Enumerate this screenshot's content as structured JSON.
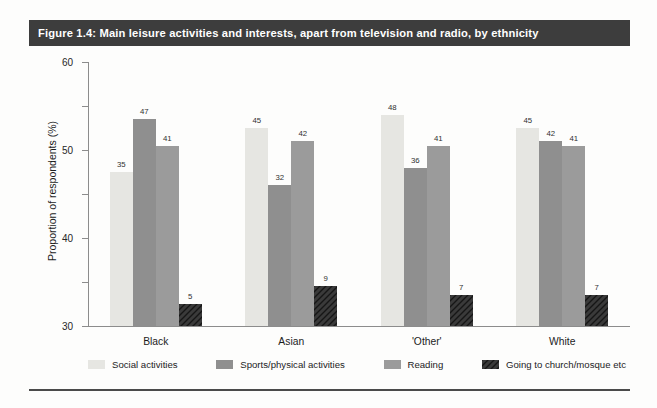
{
  "figure": {
    "title": "Figure 1.4: Main leisure activities and interests, apart from television and radio, by ethnicity",
    "title_bar_color": "#3d3d3d",
    "title_text_color": "#ffffff",
    "rule_color": "#4a4a4a"
  },
  "chart_data": {
    "type": "bar",
    "title": "Figure 1.4: Main leisure activities and interests, apart from television and radio, by ethnicity",
    "xlabel": "",
    "ylabel": "Proportion of respondents (%)",
    "ylim": [
      0,
      60
    ],
    "yticks": [
      0,
      10,
      20,
      30,
      40,
      50,
      60
    ],
    "ytick_labels": [
      "0",
      "10",
      "20",
      "30",
      "40",
      "50",
      "60"
    ],
    "grid": false,
    "legend_position": "bottom",
    "categories": [
      "Black",
      "Asian",
      "'Other'",
      "White"
    ],
    "series": [
      {
        "name": "Social activities",
        "color": "#e6e6e2",
        "pattern": "solid",
        "values": [
          35,
          45,
          48,
          45
        ]
      },
      {
        "name": "Sports/physical activities",
        "color": "#8f8f8f",
        "pattern": "solid",
        "values": [
          47,
          32,
          36,
          42
        ]
      },
      {
        "name": "Reading",
        "color": "#9b9b9b",
        "pattern": "solid",
        "values": [
          41,
          42,
          41,
          41
        ]
      },
      {
        "name": "Going to church/mosque etc",
        "color": "#3a3a3a",
        "pattern": "diagonal-hatch",
        "values": [
          5,
          9,
          7,
          7
        ]
      }
    ]
  }
}
